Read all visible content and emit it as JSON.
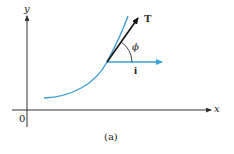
{
  "figure": {
    "caption": "(a)",
    "axes": {
      "x_label": "x",
      "y_label": "y",
      "origin_label": "0"
    },
    "vectors": {
      "tangent_label": "T",
      "unit_x_label": "i",
      "angle_label": "ϕ"
    },
    "colors": {
      "curve": "#3a9fd6",
      "unit_vector": "#3a9fd6",
      "tangent_vector": "#111111",
      "axes": "#333333"
    }
  }
}
